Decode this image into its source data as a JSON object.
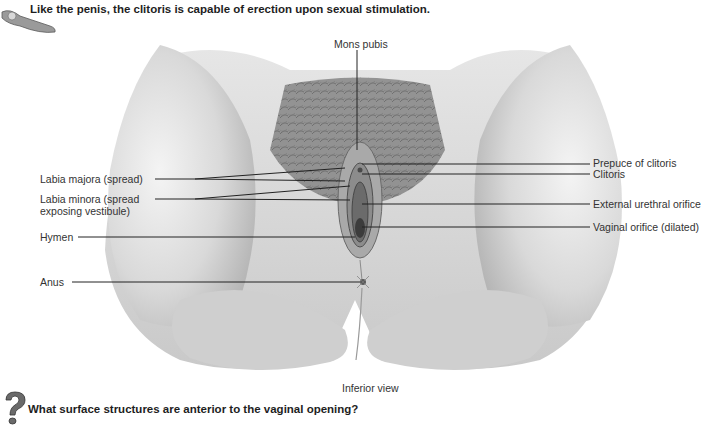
{
  "header": {
    "fact_text": "Like the penis, the clitoris is capable of erection upon sexual stimulation.",
    "icon": "key-icon"
  },
  "figure": {
    "caption": "Inferior view",
    "labels_left": [
      {
        "id": "labia-majora",
        "text": "Labia majora (spread)"
      },
      {
        "id": "labia-minora",
        "line1": "Labia minora (spread",
        "line2": "exposing vestibule)"
      },
      {
        "id": "hymen",
        "text": "Hymen"
      },
      {
        "id": "anus",
        "text": "Anus"
      }
    ],
    "labels_right": [
      {
        "id": "prepuce",
        "text": "Prepuce of clitoris"
      },
      {
        "id": "clitoris",
        "text": "Clitoris"
      },
      {
        "id": "urethral",
        "text": "External urethral orifice"
      },
      {
        "id": "vaginal",
        "text": "Vaginal orifice (dilated)"
      }
    ],
    "label_top": {
      "id": "mons",
      "text": "Mons pubis"
    }
  },
  "footer": {
    "question_text": "What surface structures are anterior to the vaginal opening?",
    "icon": "question-mark-icon"
  }
}
